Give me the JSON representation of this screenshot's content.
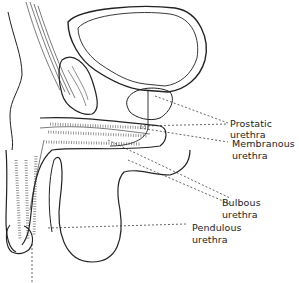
{
  "diagram": {
    "type": "anatomical-illustration",
    "labels": [
      {
        "id": "prostatic",
        "text": "Prostatic urethra"
      },
      {
        "id": "membranous_1",
        "text": "Membranous"
      },
      {
        "id": "membranous_2",
        "text": "urethra"
      },
      {
        "id": "bulbous_1",
        "text": "Bulbous"
      },
      {
        "id": "bulbous_2",
        "text": "urethra"
      },
      {
        "id": "pendulous_1",
        "text": "Pendulous"
      },
      {
        "id": "pendulous_2",
        "text": "urethra"
      }
    ],
    "colors": {
      "ink": "#222222",
      "background": "#ffffff"
    }
  }
}
